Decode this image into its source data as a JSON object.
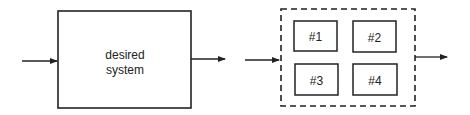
{
  "left_diagram": {
    "box_label_line1": "desired",
    "box_label_line2": "system"
  },
  "right_diagram": {
    "subsystems": [
      "#1",
      "#2",
      "#3",
      "#4"
    ]
  }
}
